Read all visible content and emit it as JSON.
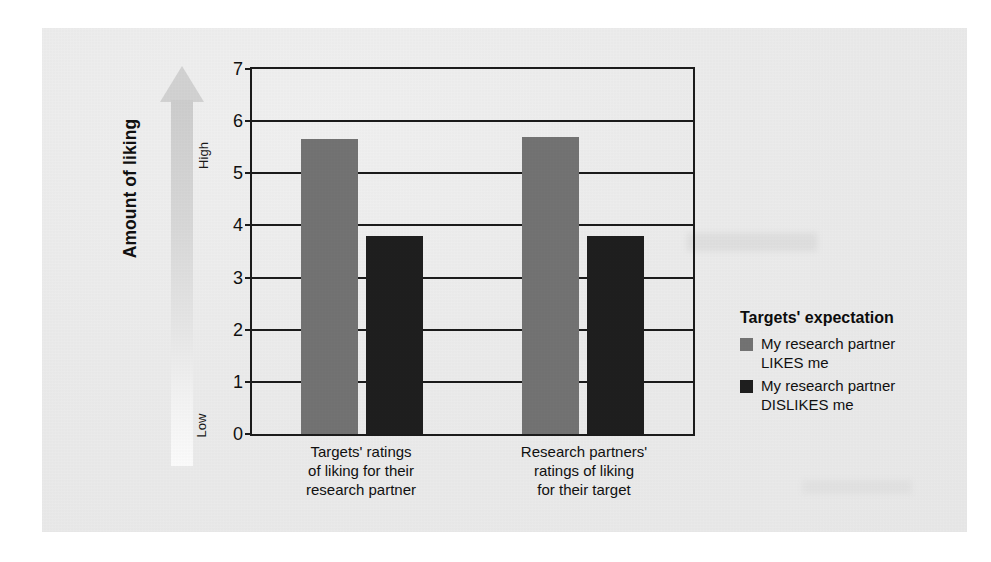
{
  "chart_data": {
    "type": "bar",
    "title": "",
    "xlabel": "",
    "ylabel": "Amount of liking",
    "ylim": [
      0,
      7
    ],
    "ytick_labels": [
      "7",
      "6",
      "5",
      "4",
      "3",
      "2",
      "1",
      "0"
    ],
    "yticks": [
      7,
      6,
      5,
      4,
      3,
      2,
      1,
      0
    ],
    "grid": true,
    "legend_position": "right",
    "categories": [
      "Targets' ratings of liking for their research partner",
      "Research partners' ratings of liking for their target"
    ],
    "series": [
      {
        "name": "My research partner LIKES me",
        "color": "#737373",
        "values": [
          5.65,
          5.7
        ]
      },
      {
        "name": "My research partner DISLIKES me",
        "color": "#1f1f1f",
        "values": [
          3.8,
          3.8
        ]
      }
    ]
  },
  "axis": {
    "y_title": "Amount of liking",
    "arrow_high_label": "High",
    "arrow_low_label": "Low"
  },
  "categories_display": [
    {
      "line1": "Targets' ratings",
      "line2": "of liking for their",
      "line3": "research partner"
    },
    {
      "line1": "Research partners'",
      "line2": "ratings of liking",
      "line3": "for their target"
    }
  ],
  "legend": {
    "title": "Targets' expectation",
    "items": [
      {
        "line1": "My research partner",
        "line2": "LIKES me",
        "color": "#737373"
      },
      {
        "line1": "My research partner",
        "line2": "DISLIKES me",
        "color": "#1f1f1f"
      }
    ]
  }
}
